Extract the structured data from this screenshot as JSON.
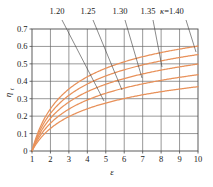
{
  "chart_data": {
    "type": "line",
    "title": "",
    "xlabel": "ε",
    "ylabel": "η",
    "ylabel_sub": "t",
    "xlim": [
      1,
      10
    ],
    "ylim": [
      0,
      0.7
    ],
    "grid": true,
    "legend_position": "top-callouts",
    "x_ticks": [
      "1",
      "2",
      "3",
      "4",
      "5",
      "6",
      "7",
      "8",
      "9",
      "10"
    ],
    "x_tick_values": [
      1,
      2,
      3,
      4,
      5,
      6,
      7,
      8,
      9,
      10
    ],
    "y_ticks": [
      "0",
      "0.1",
      "0.2",
      "0.3",
      "0.4",
      "0.5",
      "0.6",
      "0.7"
    ],
    "y_tick_values": [
      0,
      0.1,
      0.2,
      0.3,
      0.4,
      0.5,
      0.6,
      0.7
    ],
    "curve_color": "#E8915A",
    "axis_color": "#4a4a4a",
    "grid_color": "#6b6b6b",
    "callout_color": "#3a3a3a",
    "x": [
      1,
      1.25,
      1.5,
      1.75,
      2,
      2.5,
      3,
      3.5,
      4,
      4.5,
      5,
      5.5,
      6,
      6.5,
      7,
      7.5,
      8,
      8.5,
      9,
      9.5,
      10
    ],
    "series": [
      {
        "name": "1.20",
        "kappa": 1.2,
        "label": "1.20",
        "label_x": 57,
        "label_y": 14,
        "leader_from": [
          62,
          20
        ],
        "leader_to": [
          104,
          101
        ],
        "values": [
          0,
          0.0369,
          0.0658,
          0.0893,
          0.1091,
          0.1413,
          0.1667,
          0.1876,
          0.2053,
          0.2206,
          0.2341,
          0.2462,
          0.257,
          0.2669,
          0.2759,
          0.2843,
          0.292,
          0.2992,
          0.3059,
          0.3122,
          0.3182
        ]
      },
      {
        "name": "1.25",
        "kappa": 1.25,
        "label": "1.25",
        "label_x": 88,
        "label_y": 14,
        "leader_from": [
          93,
          20
        ],
        "leader_to": [
          122,
          90
        ],
        "values": [
          0,
          0.0456,
          0.0811,
          0.1098,
          0.1339,
          0.1726,
          0.203,
          0.2277,
          0.2486,
          0.2665,
          0.2823,
          0.2964,
          0.309,
          0.3204,
          0.3308,
          0.3404,
          0.3493,
          0.3576,
          0.3653,
          0.3725,
          0.3793
        ]
      },
      {
        "name": "1.30",
        "kappa": 1.3,
        "label": "1.30",
        "label_x": 120,
        "label_y": 14,
        "leader_from": [
          125,
          20
        ],
        "leader_to": [
          142,
          78
        ]
      },
      {
        "name": "1.35",
        "kappa": 1.35,
        "label": "1.35",
        "label_x": 148,
        "label_y": 14,
        "leader_from": [
          153,
          20
        ],
        "leader_to": [
          162,
          67
        ]
      },
      {
        "name": "κ=1.40",
        "kappa": 1.4,
        "label": "κ=1.40",
        "label_x": 172,
        "label_y": 14,
        "leader_from": [
          186,
          20
        ],
        "leader_to": [
          196,
          52
        ]
      }
    ],
    "endpoint_values_at_x10": [
      0.318,
      0.379,
      0.432,
      0.479,
      0.522
    ],
    "annotations": [
      {
        "text": "1.20",
        "type": "curve-label"
      },
      {
        "text": "1.25",
        "type": "curve-label"
      },
      {
        "text": "1.30",
        "type": "curve-label"
      },
      {
        "text": "1.35",
        "type": "curve-label"
      },
      {
        "text": "κ=1.40",
        "type": "curve-label"
      }
    ]
  },
  "axes": {
    "y_title": "η",
    "y_title_sub": "t",
    "x_title": "ε"
  }
}
